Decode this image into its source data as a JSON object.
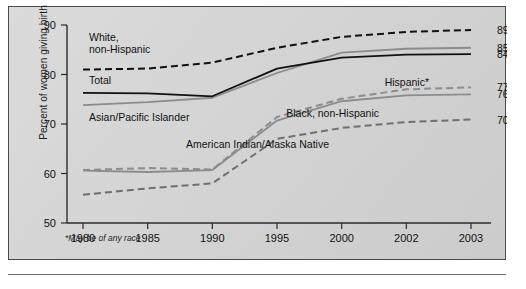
{
  "figure": {
    "footnote": "*May be of any race",
    "background_color": "#d4d4d4",
    "frame_color": "#4a4a4a"
  },
  "chart_data": {
    "type": "line",
    "title": "",
    "xlabel": "",
    "ylabel": "Percent of women giving birth",
    "categories": [
      "1980",
      "1985",
      "1990",
      "1995",
      "2000",
      "2002",
      "2003"
    ],
    "ylim": [
      50,
      90
    ],
    "yticks": [
      50,
      60,
      70,
      80,
      90
    ],
    "grid": false,
    "legend": "inline-annotations",
    "series": [
      {
        "name": "White, non-Hispanic",
        "style": "dashed",
        "color": "#111111",
        "values": [
          81.0,
          81.2,
          82.4,
          85.4,
          87.6,
          88.6,
          89.0
        ],
        "end_label": "89.0",
        "annotation": "White,\nnon-Hispanic"
      },
      {
        "name": "Asian/Pacific Islander",
        "style": "solid",
        "color": "#8c8c8c",
        "values": [
          73.8,
          74.4,
          75.3,
          80.3,
          84.4,
          85.2,
          85.4
        ],
        "end_label": "85.4",
        "annotation": "Asian/Pacific Islander"
      },
      {
        "name": "Total",
        "style": "solid",
        "color": "#111111",
        "values": [
          76.3,
          76.2,
          75.6,
          81.2,
          83.4,
          84.0,
          84.1
        ],
        "end_label": "84.1",
        "annotation": "Total"
      },
      {
        "name": "Hispanic*",
        "style": "dashed",
        "color": "#8c8c8c",
        "values": [
          60.7,
          61.1,
          60.8,
          71.4,
          75.1,
          77.0,
          77.4
        ],
        "end_label": "77.4",
        "annotation": "Hispanic*"
      },
      {
        "name": "Black, non-Hispanic",
        "style": "solid",
        "color": "#8c8c8c",
        "values": [
          60.6,
          60.3,
          60.7,
          70.7,
          74.6,
          75.8,
          76.0
        ],
        "end_label": "76.0",
        "annotation": "Black, non-Hispanic"
      },
      {
        "name": "American Indian/Alaska Native",
        "style": "dashed",
        "color": "#6f6f6f",
        "values": [
          55.7,
          57.0,
          58.0,
          67.0,
          69.2,
          70.4,
          70.9
        ],
        "end_label": "70.9",
        "annotation": "American Indian/Alaska Native"
      }
    ],
    "end_labels": [
      "89.0",
      "85.4",
      "84.1",
      "77.4",
      "76.0",
      "70.9"
    ],
    "annotations": [
      {
        "text": "White,",
        "x": 80,
        "y": 34
      },
      {
        "text": "non-Hispanic",
        "x": 80,
        "y": 46
      },
      {
        "text": "Total",
        "x": 80,
        "y": 77
      },
      {
        "text": "Asian/Pacific Islander",
        "x": 80,
        "y": 114
      },
      {
        "text": "Hispanic*",
        "x": 420,
        "y": 79
      },
      {
        "text": "Black, non-Hispanic",
        "x": 370,
        "y": 110
      },
      {
        "text": "American Indian/Alaska Native",
        "x": 320,
        "y": 141
      }
    ]
  }
}
